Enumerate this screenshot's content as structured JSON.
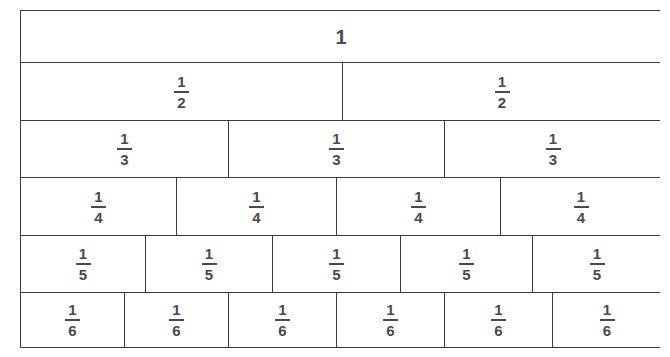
{
  "diagram": {
    "background_color": "#ffffff",
    "line_color": "#3a3a3a",
    "text_color": "#4a4a4a",
    "whole": {
      "label": "1"
    },
    "rows": [
      {
        "denominator": "1",
        "count": 1,
        "height_px": 52,
        "cells": [
          {
            "numerator": "1",
            "denominator": "1",
            "text": "1",
            "width_px": 640,
            "whole": true
          }
        ]
      },
      {
        "denominator": "2",
        "count": 2,
        "height_px": 58,
        "cells": [
          {
            "numerator": "1",
            "denominator": "2",
            "text": "1/2",
            "width_px": 322
          },
          {
            "numerator": "1",
            "denominator": "2",
            "text": "1/2",
            "width_px": 318
          }
        ]
      },
      {
        "denominator": "3",
        "count": 3,
        "height_px": 57,
        "cells": [
          {
            "numerator": "1",
            "denominator": "3",
            "text": "1/3",
            "width_px": 208
          },
          {
            "numerator": "1",
            "denominator": "3",
            "text": "1/3",
            "width_px": 216
          },
          {
            "numerator": "1",
            "denominator": "3",
            "text": "1/3",
            "width_px": 216
          }
        ]
      },
      {
        "denominator": "4",
        "count": 4,
        "height_px": 58,
        "cells": [
          {
            "numerator": "1",
            "denominator": "4",
            "text": "1/4",
            "width_px": 156
          },
          {
            "numerator": "1",
            "denominator": "4",
            "text": "1/4",
            "width_px": 160
          },
          {
            "numerator": "1",
            "denominator": "4",
            "text": "1/4",
            "width_px": 164
          },
          {
            "numerator": "1",
            "denominator": "4",
            "text": "1/4",
            "width_px": 160
          }
        ]
      },
      {
        "denominator": "5",
        "count": 5,
        "height_px": 57,
        "cells": [
          {
            "numerator": "1",
            "denominator": "5",
            "text": "1/5",
            "width_px": 125
          },
          {
            "numerator": "1",
            "denominator": "5",
            "text": "1/5",
            "width_px": 127
          },
          {
            "numerator": "1",
            "denominator": "5",
            "text": "1/5",
            "width_px": 128
          },
          {
            "numerator": "1",
            "denominator": "5",
            "text": "1/5",
            "width_px": 132
          },
          {
            "numerator": "1",
            "denominator": "5",
            "text": "1/5",
            "width_px": 128
          }
        ]
      },
      {
        "denominator": "6",
        "count": 6,
        "height_px": 56,
        "cells": [
          {
            "numerator": "1",
            "denominator": "6",
            "text": "1/6",
            "width_px": 104
          },
          {
            "numerator": "1",
            "denominator": "6",
            "text": "1/6",
            "width_px": 104
          },
          {
            "numerator": "1",
            "denominator": "6",
            "text": "1/6",
            "width_px": 108
          },
          {
            "numerator": "1",
            "denominator": "6",
            "text": "1/6",
            "width_px": 108
          },
          {
            "numerator": "1",
            "denominator": "6",
            "text": "1/6",
            "width_px": 108
          },
          {
            "numerator": "1",
            "denominator": "6",
            "text": "1/6",
            "width_px": 108
          }
        ]
      }
    ]
  },
  "chart_data": {
    "type": "bar",
    "xlabel": "",
    "ylabel": "",
    "categories": [
      "1",
      "1/2",
      "1/3",
      "1/4",
      "1/5",
      "1/6"
    ],
    "values": [
      1,
      0.5,
      0.3333333333,
      0.25,
      0.2,
      0.1666666667
    ],
    "series": [
      {
        "name": "whole",
        "denominator": 1,
        "parts": 1,
        "part_value": 1,
        "labels": [
          "1"
        ]
      },
      {
        "name": "halves",
        "denominator": 2,
        "parts": 2,
        "part_value": 0.5,
        "labels": [
          "1/2",
          "1/2"
        ]
      },
      {
        "name": "thirds",
        "denominator": 3,
        "parts": 3,
        "part_value": 0.3333333333,
        "labels": [
          "1/3",
          "1/3",
          "1/3"
        ]
      },
      {
        "name": "quarters",
        "denominator": 4,
        "parts": 4,
        "part_value": 0.25,
        "labels": [
          "1/4",
          "1/4",
          "1/4",
          "1/4"
        ]
      },
      {
        "name": "fifths",
        "denominator": 5,
        "parts": 5,
        "part_value": 0.2,
        "labels": [
          "1/5",
          "1/5",
          "1/5",
          "1/5",
          "1/5"
        ]
      },
      {
        "name": "sixths",
        "denominator": 6,
        "parts": 6,
        "part_value": 0.1666666667,
        "labels": [
          "1/6",
          "1/6",
          "1/6",
          "1/6",
          "1/6",
          "1/6"
        ]
      }
    ],
    "xlim": [
      0,
      1
    ],
    "grid": false,
    "legend": "none"
  }
}
